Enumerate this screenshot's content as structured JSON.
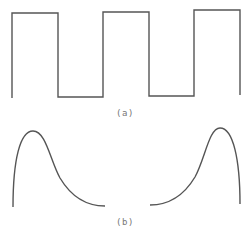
{
  "figure": {
    "stroke_color": "#555555",
    "caption_color": "#777777",
    "panels": [
      {
        "id": "a",
        "caption": "(a)",
        "description": "square wave",
        "path": "M12,98 L12,13 L58,13 L58,97 L103,97 L103,12 L149,12 L149,96 L194,96 L194,10 L240,10 L240,95"
      },
      {
        "id": "b",
        "caption": "(b)",
        "description": "two mirrored single-peak pulses",
        "left_path": "M13,207 C13,160 20,131 33,131 C46,131 50,160 60,178 C72,198 88,206 105,206",
        "right_path": "M150,205 C167,205 183,197 195,177 C205,159 209,128 220,128 C233,128 240,159 240,204"
      }
    ]
  }
}
